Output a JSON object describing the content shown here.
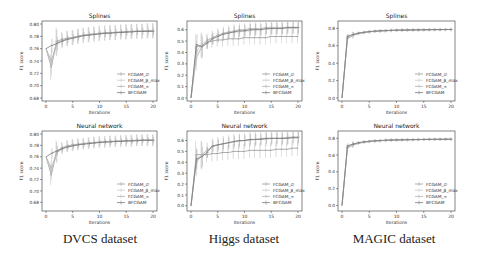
{
  "figure": {
    "captions": [
      "DVCS dataset",
      "Higgs dataset",
      "MAGIC dataset"
    ]
  },
  "legend_entries": [
    "FCGAM_∅",
    "FCGAM_β_max",
    "FCGAM_∞",
    "BFCGAM"
  ],
  "colors": {
    "FCGAM_empty": "#9a9a9a",
    "FCGAM_beta_max": "#c8c8c8",
    "FCGAM_inf": "#b0b0b0",
    "BFCGAM": "#7a7a7a",
    "axes": "#333333"
  },
  "chart_data": [
    {
      "type": "line",
      "dataset": "DVCS dataset",
      "title": "Splines",
      "xlabel": "Iterations",
      "ylabel": "F1 score",
      "xlim": [
        0,
        20
      ],
      "ylim": [
        0.68,
        0.8
      ],
      "xticks": [
        0,
        5,
        10,
        15,
        20
      ],
      "yticks": [
        0.68,
        0.7,
        0.72,
        0.74,
        0.76,
        0.78,
        0.8
      ],
      "ytick_labels": [
        "0.68",
        "0.70",
        "0.72",
        "0.74",
        "0.76",
        "0.78",
        "0.80"
      ],
      "legend_position": "lower right",
      "error_bars": true,
      "x": [
        0,
        1,
        2,
        3,
        4,
        5,
        6,
        7,
        8,
        9,
        10,
        11,
        12,
        13,
        14,
        15,
        16,
        17,
        18,
        19,
        20
      ],
      "series": [
        {
          "name": "FCGAM_∅",
          "values": [
            0.76,
            0.73,
            0.772,
            0.775,
            0.777,
            0.778,
            0.78,
            0.782,
            0.783,
            0.784,
            0.785,
            0.785,
            0.786,
            0.786,
            0.787,
            0.787,
            0.788,
            0.788,
            0.788,
            0.789,
            0.789
          ],
          "err": 0.012
        },
        {
          "name": "FCGAM_β_max",
          "values": [
            0.76,
            0.735,
            0.77,
            0.773,
            0.776,
            0.778,
            0.78,
            0.782,
            0.783,
            0.784,
            0.785,
            0.786,
            0.786,
            0.787,
            0.787,
            0.788,
            0.788,
            0.789,
            0.789,
            0.789,
            0.79
          ],
          "err": 0.012
        },
        {
          "name": "FCGAM_∞",
          "values": [
            0.76,
            0.74,
            0.769,
            0.773,
            0.776,
            0.778,
            0.78,
            0.781,
            0.782,
            0.783,
            0.784,
            0.785,
            0.786,
            0.786,
            0.787,
            0.787,
            0.788,
            0.788,
            0.788,
            0.789,
            0.789
          ],
          "err": 0.012
        },
        {
          "name": "BFCGAM",
          "values": [
            0.76,
            0.765,
            0.768,
            0.772,
            0.775,
            0.777,
            0.779,
            0.781,
            0.782,
            0.783,
            0.784,
            0.785,
            0.785,
            0.786,
            0.786,
            0.787,
            0.787,
            0.788,
            0.788,
            0.788,
            0.788
          ],
          "err": 0.006
        }
      ]
    },
    {
      "type": "line",
      "dataset": "Higgs dataset",
      "title": "Splines",
      "xlabel": "Iterations",
      "ylabel": "F1 score",
      "xlim": [
        0,
        20
      ],
      "ylim": [
        0.0,
        0.65
      ],
      "xticks": [
        0,
        5,
        10,
        15,
        20
      ],
      "yticks": [
        0.0,
        0.1,
        0.2,
        0.3,
        0.4,
        0.5,
        0.6
      ],
      "ytick_labels": [
        "0.0",
        "0.1",
        "0.2",
        "0.3",
        "0.4",
        "0.5",
        "0.6"
      ],
      "legend_position": "lower right",
      "error_bars": true,
      "x": [
        0,
        1,
        2,
        3,
        4,
        5,
        6,
        7,
        8,
        9,
        10,
        11,
        12,
        13,
        14,
        15,
        16,
        17,
        18,
        19,
        20
      ],
      "series": [
        {
          "name": "FCGAM_∅",
          "values": [
            0.0,
            0.45,
            0.46,
            0.49,
            0.5,
            0.51,
            0.51,
            0.52,
            0.52,
            0.52,
            0.53,
            0.53,
            0.53,
            0.53,
            0.53,
            0.54,
            0.54,
            0.54,
            0.54,
            0.54,
            0.54
          ],
          "err": 0.06
        },
        {
          "name": "FCGAM_β_max",
          "values": [
            0.0,
            0.4,
            0.47,
            0.51,
            0.53,
            0.55,
            0.56,
            0.57,
            0.58,
            0.58,
            0.59,
            0.59,
            0.6,
            0.6,
            0.6,
            0.61,
            0.61,
            0.61,
            0.61,
            0.61,
            0.61
          ],
          "err": 0.06
        },
        {
          "name": "FCGAM_∞",
          "values": [
            0.0,
            0.35,
            0.45,
            0.5,
            0.53,
            0.55,
            0.57,
            0.58,
            0.59,
            0.6,
            0.6,
            0.61,
            0.61,
            0.61,
            0.62,
            0.62,
            0.62,
            0.62,
            0.62,
            0.62,
            0.62
          ],
          "err": 0.06
        },
        {
          "name": "BFCGAM",
          "values": [
            0.0,
            0.47,
            0.45,
            0.48,
            0.52,
            0.54,
            0.56,
            0.57,
            0.58,
            0.59,
            0.59,
            0.6,
            0.6,
            0.6,
            0.61,
            0.61,
            0.61,
            0.61,
            0.62,
            0.62,
            0.62
          ],
          "err": 0.05
        }
      ]
    },
    {
      "type": "line",
      "dataset": "MAGIC dataset",
      "title": "Splines",
      "xlabel": "Iterations",
      "ylabel": "F1 score",
      "xlim": [
        0,
        20
      ],
      "ylim": [
        0.0,
        0.85
      ],
      "xticks": [
        0,
        5,
        10,
        15,
        20
      ],
      "yticks": [
        0.0,
        0.2,
        0.4,
        0.6,
        0.8
      ],
      "ytick_labels": [
        "0.0",
        "0.2",
        "0.4",
        "0.6",
        "0.8"
      ],
      "legend_position": "lower right",
      "error_bars": true,
      "x": [
        0,
        1,
        2,
        3,
        4,
        5,
        6,
        7,
        8,
        9,
        10,
        11,
        12,
        13,
        14,
        15,
        16,
        17,
        18,
        19,
        20
      ],
      "series": [
        {
          "name": "FCGAM_∅",
          "values": [
            0.0,
            0.69,
            0.72,
            0.74,
            0.75,
            0.76,
            0.765,
            0.77,
            0.772,
            0.775,
            0.777,
            0.779,
            0.78,
            0.781,
            0.782,
            0.783,
            0.784,
            0.785,
            0.785,
            0.786,
            0.786
          ],
          "err": 0.02
        },
        {
          "name": "FCGAM_β_max",
          "values": [
            0.0,
            0.7,
            0.73,
            0.745,
            0.755,
            0.762,
            0.768,
            0.772,
            0.775,
            0.777,
            0.779,
            0.78,
            0.781,
            0.782,
            0.783,
            0.784,
            0.785,
            0.786,
            0.786,
            0.787,
            0.787
          ],
          "err": 0.02
        },
        {
          "name": "FCGAM_∞",
          "values": [
            0.0,
            0.68,
            0.72,
            0.74,
            0.752,
            0.76,
            0.766,
            0.77,
            0.773,
            0.776,
            0.778,
            0.78,
            0.781,
            0.782,
            0.783,
            0.784,
            0.785,
            0.785,
            0.786,
            0.786,
            0.787
          ],
          "err": 0.02
        },
        {
          "name": "BFCGAM",
          "values": [
            0.0,
            0.71,
            0.73,
            0.745,
            0.755,
            0.763,
            0.768,
            0.772,
            0.775,
            0.777,
            0.779,
            0.78,
            0.781,
            0.782,
            0.783,
            0.784,
            0.785,
            0.786,
            0.786,
            0.787,
            0.787
          ],
          "err": 0.015
        }
      ]
    },
    {
      "type": "line",
      "dataset": "DVCS dataset",
      "title": "Neural network",
      "xlabel": "Iterations",
      "ylabel": "F1 score",
      "xlim": [
        0,
        20
      ],
      "ylim": [
        0.67,
        0.8
      ],
      "xticks": [
        0,
        5,
        10,
        15,
        20
      ],
      "yticks": [
        0.68,
        0.7,
        0.72,
        0.74,
        0.76,
        0.78,
        0.8
      ],
      "ytick_labels": [
        "0.68",
        "0.70",
        "0.72",
        "0.74",
        "0.76",
        "0.78",
        "0.80"
      ],
      "legend_position": "lower right",
      "error_bars": true,
      "x": [
        0,
        1,
        2,
        3,
        4,
        5,
        6,
        7,
        8,
        9,
        10,
        11,
        12,
        13,
        14,
        15,
        16,
        17,
        18,
        19,
        20
      ],
      "series": [
        {
          "name": "FCGAM_∅",
          "values": [
            0.76,
            0.728,
            0.77,
            0.776,
            0.779,
            0.781,
            0.782,
            0.783,
            0.784,
            0.785,
            0.786,
            0.786,
            0.787,
            0.787,
            0.788,
            0.788,
            0.788,
            0.789,
            0.789,
            0.789,
            0.789
          ],
          "err": 0.01
        },
        {
          "name": "FCGAM_β_max",
          "values": [
            0.76,
            0.735,
            0.768,
            0.775,
            0.778,
            0.78,
            0.782,
            0.783,
            0.784,
            0.785,
            0.786,
            0.786,
            0.787,
            0.787,
            0.788,
            0.788,
            0.789,
            0.789,
            0.789,
            0.79,
            0.79
          ],
          "err": 0.01
        },
        {
          "name": "FCGAM_∞",
          "values": [
            0.76,
            0.74,
            0.767,
            0.774,
            0.778,
            0.78,
            0.781,
            0.783,
            0.784,
            0.785,
            0.785,
            0.786,
            0.787,
            0.787,
            0.787,
            0.788,
            0.788,
            0.789,
            0.789,
            0.789,
            0.789
          ],
          "err": 0.01
        },
        {
          "name": "BFCGAM",
          "values": [
            0.76,
            0.766,
            0.77,
            0.774,
            0.777,
            0.779,
            0.781,
            0.782,
            0.783,
            0.784,
            0.785,
            0.786,
            0.786,
            0.787,
            0.787,
            0.788,
            0.788,
            0.788,
            0.789,
            0.789,
            0.789
          ],
          "err": 0.005
        }
      ]
    },
    {
      "type": "line",
      "dataset": "Higgs dataset",
      "title": "Neural network",
      "xlabel": "Iterations",
      "ylabel": "F1 score",
      "xlim": [
        0,
        20
      ],
      "ylim": [
        -0.02,
        0.66
      ],
      "xticks": [
        0,
        5,
        10,
        15,
        20
      ],
      "yticks": [
        0.0,
        0.1,
        0.2,
        0.3,
        0.4,
        0.5,
        0.6
      ],
      "ytick_labels": [
        "0.0",
        "0.1",
        "0.2",
        "0.3",
        "0.4",
        "0.5",
        "0.6"
      ],
      "legend_position": "lower right",
      "error_bars": true,
      "x": [
        0,
        1,
        2,
        3,
        4,
        5,
        6,
        7,
        8,
        9,
        10,
        11,
        12,
        13,
        14,
        15,
        16,
        17,
        18,
        19,
        20
      ],
      "series": [
        {
          "name": "FCGAM_∅",
          "values": [
            0.0,
            0.47,
            0.47,
            0.47,
            0.48,
            0.48,
            0.49,
            0.49,
            0.5,
            0.5,
            0.5,
            0.51,
            0.51,
            0.51,
            0.51,
            0.51,
            0.52,
            0.52,
            0.52,
            0.53,
            0.53
          ],
          "err": 0.07
        },
        {
          "name": "FCGAM_β_max",
          "values": [
            0.0,
            0.42,
            0.47,
            0.51,
            0.54,
            0.56,
            0.57,
            0.58,
            0.59,
            0.59,
            0.6,
            0.6,
            0.61,
            0.61,
            0.61,
            0.62,
            0.62,
            0.62,
            0.62,
            0.62,
            0.62
          ],
          "err": 0.07
        },
        {
          "name": "FCGAM_∞",
          "values": [
            0.0,
            0.4,
            0.46,
            0.51,
            0.55,
            0.56,
            0.57,
            0.58,
            0.59,
            0.6,
            0.6,
            0.61,
            0.61,
            0.62,
            0.62,
            0.62,
            0.62,
            0.62,
            0.63,
            0.63,
            0.63
          ],
          "err": 0.07
        },
        {
          "name": "BFCGAM",
          "values": [
            0.0,
            0.43,
            0.45,
            0.49,
            0.55,
            0.56,
            0.57,
            0.58,
            0.59,
            0.6,
            0.6,
            0.61,
            0.61,
            0.61,
            0.62,
            0.62,
            0.62,
            0.62,
            0.62,
            0.63,
            0.63
          ],
          "err": 0.05
        }
      ]
    },
    {
      "type": "line",
      "dataset": "MAGIC dataset",
      "title": "Neural network",
      "xlabel": "Iterations",
      "ylabel": "F1 score",
      "xlim": [
        0,
        20
      ],
      "ylim": [
        -0.03,
        0.85
      ],
      "xticks": [
        0,
        5,
        10,
        15,
        20
      ],
      "yticks": [
        0.0,
        0.2,
        0.4,
        0.6,
        0.8
      ],
      "ytick_labels": [
        "0.0",
        "0.2",
        "0.4",
        "0.6",
        "0.8"
      ],
      "legend_position": "lower right",
      "error_bars": true,
      "x": [
        0,
        1,
        2,
        3,
        4,
        5,
        6,
        7,
        8,
        9,
        10,
        11,
        12,
        13,
        14,
        15,
        16,
        17,
        18,
        19,
        20
      ],
      "series": [
        {
          "name": "FCGAM_∅",
          "values": [
            0.0,
            0.69,
            0.72,
            0.74,
            0.752,
            0.76,
            0.766,
            0.77,
            0.774,
            0.777,
            0.779,
            0.781,
            0.782,
            0.783,
            0.784,
            0.785,
            0.786,
            0.786,
            0.787,
            0.787,
            0.788
          ],
          "err": 0.02
        },
        {
          "name": "FCGAM_β_max",
          "values": [
            0.0,
            0.7,
            0.73,
            0.745,
            0.756,
            0.763,
            0.768,
            0.772,
            0.775,
            0.778,
            0.78,
            0.781,
            0.782,
            0.783,
            0.784,
            0.785,
            0.786,
            0.787,
            0.787,
            0.788,
            0.788
          ],
          "err": 0.02
        },
        {
          "name": "FCGAM_∞",
          "values": [
            0.0,
            0.68,
            0.72,
            0.74,
            0.752,
            0.76,
            0.766,
            0.771,
            0.774,
            0.777,
            0.779,
            0.781,
            0.782,
            0.783,
            0.784,
            0.785,
            0.786,
            0.786,
            0.787,
            0.787,
            0.788
          ],
          "err": 0.02
        },
        {
          "name": "BFCGAM",
          "values": [
            0.0,
            0.71,
            0.73,
            0.746,
            0.757,
            0.764,
            0.769,
            0.773,
            0.776,
            0.778,
            0.78,
            0.781,
            0.782,
            0.783,
            0.784,
            0.785,
            0.786,
            0.787,
            0.787,
            0.788,
            0.788
          ],
          "err": 0.015
        }
      ]
    }
  ]
}
